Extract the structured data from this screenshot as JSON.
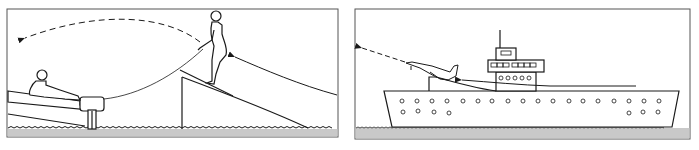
{
  "figure": {
    "panels": [
      {
        "id": "ski-jump-panel",
        "subject": "water skier launching off ramp towed by boat",
        "elements": [
          "boat",
          "boat-driver",
          "tow-rope",
          "water-skier",
          "ski-ramp",
          "approach-path-arrow",
          "trajectory-arrow-dashed",
          "water"
        ]
      },
      {
        "id": "ship-panel",
        "subject": "aircraft taking off from ship ski-jump ramp",
        "elements": [
          "ship-hull",
          "superstructure",
          "mast",
          "portholes",
          "ski-jump-ramp",
          "aircraft",
          "takeoff-run-arrow",
          "trajectory-arrow-dashed",
          "water"
        ]
      }
    ],
    "colors": {
      "line": "#1a1a1a",
      "water": "#c9c9c9",
      "border": "#555555",
      "background": "#ffffff"
    }
  }
}
